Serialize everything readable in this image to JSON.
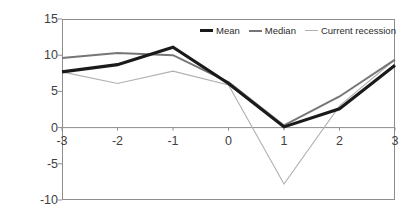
{
  "chart_data": {
    "type": "line",
    "title": "",
    "subtitle": "",
    "xlabel": "",
    "ylabel": "",
    "x": [
      -3,
      -2,
      -1,
      0,
      1,
      2,
      3
    ],
    "categories": [
      "-3",
      "-2",
      "-1",
      "0",
      "1",
      "2",
      "3"
    ],
    "xlim": [
      -3,
      3
    ],
    "ylim": [
      -10,
      15
    ],
    "y_ticks": [
      15,
      10,
      5,
      0,
      -5,
      -10
    ],
    "x_ticks": [
      -3,
      -2,
      -1,
      0,
      1,
      2,
      3
    ],
    "grid": false,
    "zero_line": true,
    "legend_position": "top-right-inside",
    "series": [
      {
        "name": "Mean",
        "color": "#1a1a1a",
        "width": 3.1,
        "values": [
          7.7,
          8.7,
          11.1,
          6.1,
          0.1,
          2.6,
          8.6
        ]
      },
      {
        "name": "Median",
        "color": "#767676",
        "width": 2.0,
        "values": [
          9.6,
          10.3,
          10.0,
          6.3,
          0.3,
          4.3,
          9.4
        ]
      },
      {
        "name": "Current recession",
        "color": "#b0b0b0",
        "width": 1.1,
        "values": [
          7.7,
          6.1,
          7.8,
          5.9,
          -7.8,
          3.0,
          9.4
        ]
      }
    ]
  },
  "axis": {
    "y_tick_labels": [
      "15",
      "10",
      "5",
      "0",
      "-5",
      "-10"
    ],
    "x_tick_labels": [
      "-3",
      "-2",
      "-1",
      "0",
      "1",
      "2",
      "3"
    ]
  },
  "legend": {
    "entries": [
      {
        "label": "Mean",
        "color": "#1a1a1a",
        "width": 3.1
      },
      {
        "label": "Median",
        "color": "#767676",
        "width": 2.0
      },
      {
        "label": "Current recession",
        "color": "#b0b0b0",
        "width": 1.1
      }
    ]
  },
  "style": {
    "frame_color": "#8d8d8d",
    "zero_line_color": "#8d8d8d",
    "tick_color": "#8d8d8d",
    "text_color": "#3f3f3f",
    "background": "#ffffff"
  }
}
